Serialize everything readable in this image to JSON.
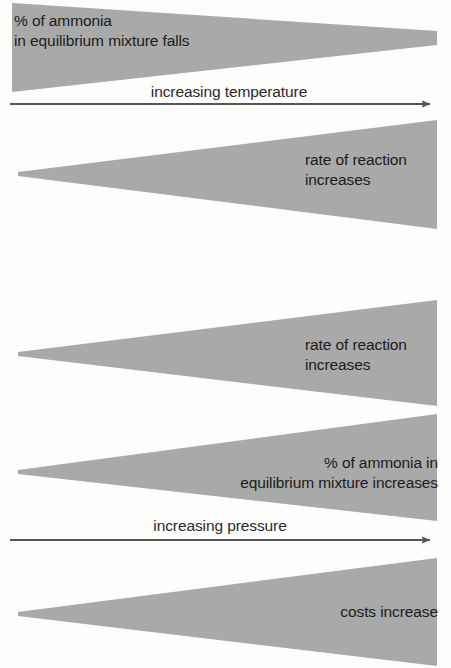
{
  "figure": {
    "background_color": "#fdfdfc",
    "wedge_color": "#a9a9a9",
    "text_color": "#1b1b1b",
    "arrow_color": "#555555"
  },
  "wedges": [
    {
      "id": "ammonia-percent-falls",
      "direction": "narrowing-right",
      "label_line1": "% of ammonia",
      "label_line2": "in equilibrium mixture falls",
      "label_align": "left",
      "points": "12,3 437,31 437,45 12,92"
    },
    {
      "id": "rate-of-reaction-increases-temperature",
      "direction": "widening-right",
      "label_line1": "rate of reaction",
      "label_line2": "increases",
      "label_align": "left",
      "points": "18,172 437,120 437,229 18,176"
    },
    {
      "id": "rate-of-reaction-increases-pressure",
      "direction": "widening-right",
      "label_line1": "rate of reaction",
      "label_line2": "increases",
      "label_align": "left",
      "points": "18,352 437,300 437,406 18,356"
    },
    {
      "id": "ammonia-percent-increases",
      "direction": "widening-right",
      "label_line1": "% of ammonia in",
      "label_line2": "equilibrium mixture increases",
      "label_align": "right",
      "points": "18,470 437,414 437,521 18,474"
    },
    {
      "id": "costs-increase",
      "direction": "widening-right",
      "label_line1": "costs increase",
      "label_line2": "",
      "label_align": "right",
      "points": "18,612 437,558 437,666 18,616"
    }
  ],
  "arrows": [
    {
      "id": "increasing-temperature",
      "label": "increasing temperature",
      "x_start": 10,
      "x_end": 437,
      "y": 104
    },
    {
      "id": "increasing-pressure",
      "label": "increasing pressure",
      "x_start": 10,
      "x_end": 437,
      "y": 540
    }
  ]
}
